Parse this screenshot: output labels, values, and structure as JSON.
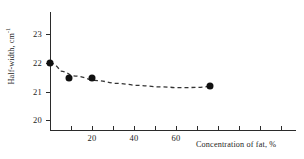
{
  "chart_data": {
    "type": "scatter",
    "title": "",
    "xlabel": "Concentration of fat, %",
    "ylabel": "Half-width, cm",
    "ylabel_exponent": "-1",
    "xlim": [
      0,
      80
    ],
    "ylim": [
      19.5,
      23.5
    ],
    "grid": false,
    "legend": "none",
    "x_ticks": [
      0,
      10,
      20,
      30,
      40,
      50,
      60,
      70,
      80
    ],
    "x_tick_labels": [
      "",
      "",
      "20",
      "",
      "40",
      "",
      "60",
      "",
      ""
    ],
    "y_ticks": [
      20,
      21,
      22,
      23
    ],
    "y_tick_labels": [
      "20",
      "21",
      "22",
      "23"
    ],
    "series": [
      {
        "name": "Half-width vs fat concentration",
        "marker": "filled-circle",
        "color": "#111111",
        "points": [
          {
            "x": 0,
            "y": 22.0
          },
          {
            "x": 9,
            "y": 21.5
          },
          {
            "x": 20,
            "y": 21.47
          },
          {
            "x": 76,
            "y": 21.2
          }
        ]
      }
    ],
    "trend": {
      "style": "dashed",
      "color": "#333333",
      "points": [
        {
          "x": 0,
          "y": 22.0
        },
        {
          "x": 5,
          "y": 21.72
        },
        {
          "x": 10,
          "y": 21.56
        },
        {
          "x": 20,
          "y": 21.4
        },
        {
          "x": 30,
          "y": 21.3
        },
        {
          "x": 40,
          "y": 21.23
        },
        {
          "x": 50,
          "y": 21.18
        },
        {
          "x": 60,
          "y": 21.15
        },
        {
          "x": 70,
          "y": 21.16
        },
        {
          "x": 76,
          "y": 21.2
        }
      ]
    }
  },
  "axes": {
    "y_title_text": "Half-width, cm",
    "y_title_sup": "-1",
    "x_title_text": "Concentration of fat, %",
    "y_labels": [
      "23",
      "22",
      "21",
      "20"
    ],
    "x_labels": [
      "20",
      "40",
      "60"
    ]
  }
}
